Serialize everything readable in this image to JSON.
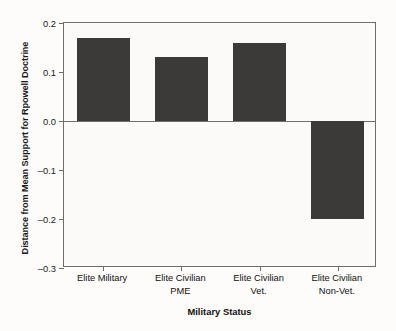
{
  "chart_data": {
    "type": "bar",
    "title": "",
    "xlabel": "Military Status",
    "ylabel": "Distance from Mean Support for Rpowell Doctrine",
    "categories": [
      "Elite Military",
      "Elite Civilian\nPME",
      "Elite Civilian\nVet.",
      "Elite Civilian\nNon-Vet."
    ],
    "values": [
      0.17,
      0.13,
      0.16,
      -0.2
    ],
    "ylim": [
      -0.3,
      0.2
    ],
    "yticks": [
      0.2,
      0.1,
      0.0,
      -0.1,
      -0.2,
      -0.3
    ],
    "ytick_labels": [
      "0.2",
      "0.1",
      "0.0",
      "–0.1",
      "–0.2",
      "–0.3"
    ],
    "grid": false,
    "legend": null,
    "bar_color": "#3c3a39",
    "axis_color": "#6e6e6a",
    "background_color": "#fbfaf8"
  }
}
